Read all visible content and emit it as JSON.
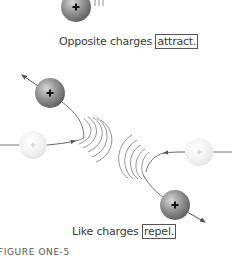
{
  "diagram": {
    "top_caption": {
      "prefix": "Opposite charges ",
      "boxed": "attract."
    },
    "bottom_caption": {
      "prefix": "Like charges ",
      "boxed": "repel."
    },
    "figure_label": "FIGURE ONE-5",
    "charge_symbol": "+",
    "colors": {
      "sphere_dark": "#8a8a8a",
      "sphere_light": "#efefef",
      "line": "#555555",
      "text": "#3a3a3a"
    },
    "elements": [
      {
        "id": "top-sphere",
        "type": "charged-particle",
        "charge": "+",
        "tone": "dark"
      },
      {
        "id": "upper-left-sphere",
        "type": "charged-particle",
        "charge": "+",
        "tone": "dark",
        "motion": "up-left"
      },
      {
        "id": "left-faint-sphere",
        "type": "charged-particle",
        "charge": "+",
        "tone": "light",
        "motion": "right"
      },
      {
        "id": "right-faint-sphere",
        "type": "charged-particle",
        "charge": "+",
        "tone": "light",
        "motion": "left"
      },
      {
        "id": "lower-right-sphere",
        "type": "charged-particle",
        "charge": "+",
        "tone": "dark",
        "motion": "down-right"
      }
    ]
  }
}
